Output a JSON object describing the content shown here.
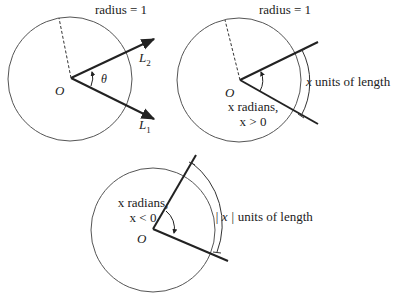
{
  "colors": {
    "background": "#ffffff",
    "ink": "#222222",
    "circle": "#555555"
  },
  "diagram": {
    "panel_1": {
      "caption": "radius = 1",
      "origin_label": "O",
      "angle_label": "θ",
      "ray_1_label": "L",
      "ray_1_sub": "1",
      "ray_2_label": "L",
      "ray_2_sub": "2"
    },
    "panel_2": {
      "caption": "radius = 1",
      "origin_label": "O",
      "angle_label_line1": "x radians,",
      "angle_label_line2": "x > 0",
      "arc_label_var": "x",
      "arc_label_text": " units of length"
    },
    "panel_3": {
      "origin_label": "O",
      "angle_label_line1": "x radians,",
      "angle_label_line2": "x < 0",
      "arc_label_var": "| x |",
      "arc_label_text": "  units of length"
    }
  }
}
